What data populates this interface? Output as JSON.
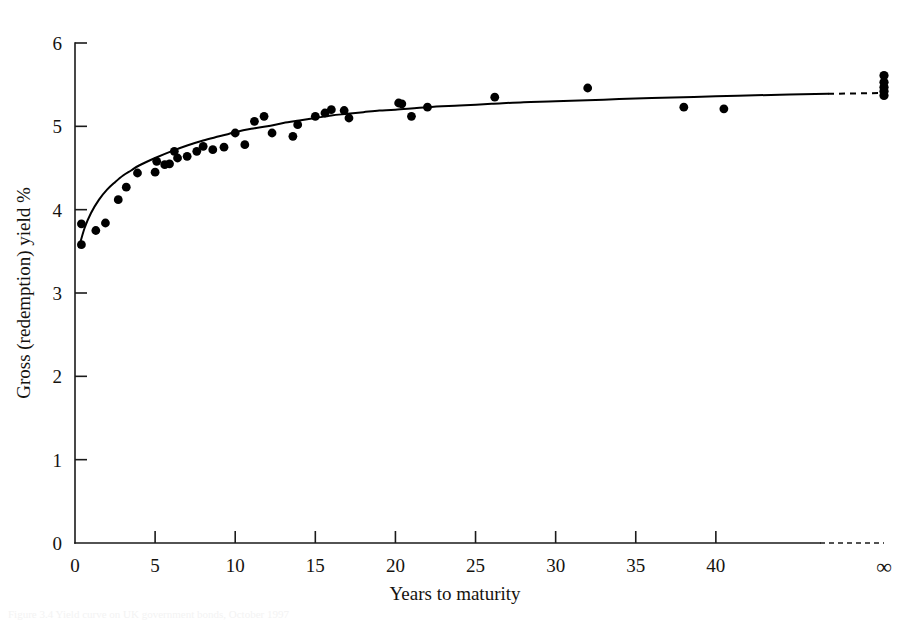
{
  "figure": {
    "background_color": "#ffffff",
    "ink_color": "#000000",
    "bottom_partial_caption": "Figure 3.4 Yield curve on UK government bonds, October 1997"
  },
  "chart_data": {
    "type": "scatter",
    "title": "",
    "subtitle": "",
    "xlabel": "Years to maturity",
    "ylabel": "Gross (redemption) yield %",
    "xlim": [
      0,
      50
    ],
    "ylim": [
      0,
      6
    ],
    "grid": false,
    "legend": null,
    "x_ticks": [
      "0",
      "5",
      "10",
      "15",
      "20",
      "25",
      "30",
      "35",
      "40"
    ],
    "x_tick_values": [
      0,
      5,
      10,
      15,
      20,
      25,
      30,
      35,
      40
    ],
    "x_extra_tick_label": "∞",
    "y_ticks": [
      "0",
      "1",
      "2",
      "3",
      "4",
      "5",
      "6"
    ],
    "y_tick_values": [
      0,
      1,
      2,
      3,
      4,
      5,
      6
    ],
    "axis_dashed_tail": true,
    "series": [
      {
        "name": "Gross redemption yield observations",
        "marker": "filled-circle",
        "color": "#000000",
        "points": [
          [
            0.4,
            3.83
          ],
          [
            0.4,
            3.58
          ],
          [
            1.3,
            3.75
          ],
          [
            1.9,
            3.84
          ],
          [
            2.7,
            4.12
          ],
          [
            3.2,
            4.27
          ],
          [
            3.9,
            4.44
          ],
          [
            5.0,
            4.45
          ],
          [
            5.1,
            4.58
          ],
          [
            5.6,
            4.54
          ],
          [
            5.9,
            4.55
          ],
          [
            6.2,
            4.7
          ],
          [
            6.4,
            4.62
          ],
          [
            7.0,
            4.64
          ],
          [
            7.6,
            4.7
          ],
          [
            8.0,
            4.76
          ],
          [
            8.6,
            4.72
          ],
          [
            9.3,
            4.75
          ],
          [
            10.0,
            4.92
          ],
          [
            10.6,
            4.78
          ],
          [
            11.2,
            5.06
          ],
          [
            11.8,
            5.12
          ],
          [
            12.3,
            4.92
          ],
          [
            13.6,
            4.88
          ],
          [
            13.9,
            5.02
          ],
          [
            15.0,
            5.12
          ],
          [
            15.6,
            5.16
          ],
          [
            16.0,
            5.2
          ],
          [
            16.8,
            5.19
          ],
          [
            17.1,
            5.1
          ],
          [
            20.2,
            5.28
          ],
          [
            20.4,
            5.27
          ],
          [
            21.0,
            5.12
          ],
          [
            22.0,
            5.23
          ],
          [
            26.2,
            5.35
          ],
          [
            32.0,
            5.46
          ],
          [
            38.0,
            5.23
          ],
          [
            40.5,
            5.21
          ]
        ]
      },
      {
        "name": "Undated (perpetual) stocks at infinity",
        "marker": "filled-circle",
        "color": "#000000",
        "at_infinity": true,
        "values": [
          5.61,
          5.53,
          5.47,
          5.42,
          5.37
        ]
      }
    ],
    "fitted_curve": {
      "name": "Fitted yield curve",
      "style": "solid-with-dashed-tail",
      "color": "#000000",
      "points": [
        [
          0.25,
          3.55
        ],
        [
          0.6,
          3.78
        ],
        [
          1.0,
          3.96
        ],
        [
          1.5,
          4.12
        ],
        [
          2.0,
          4.24
        ],
        [
          2.5,
          4.33
        ],
        [
          3.0,
          4.41
        ],
        [
          3.5,
          4.47
        ],
        [
          4.0,
          4.53
        ],
        [
          5.0,
          4.62
        ],
        [
          6.0,
          4.7
        ],
        [
          7.0,
          4.77
        ],
        [
          8.0,
          4.83
        ],
        [
          9.0,
          4.88
        ],
        [
          10.0,
          4.93
        ],
        [
          11.0,
          4.97
        ],
        [
          12.0,
          5.0
        ],
        [
          13.0,
          5.04
        ],
        [
          14.0,
          5.07
        ],
        [
          15.0,
          5.1
        ],
        [
          16.0,
          5.13
        ],
        [
          17.0,
          5.15
        ],
        [
          18.0,
          5.17
        ],
        [
          19.0,
          5.19
        ],
        [
          20.0,
          5.2
        ],
        [
          22.0,
          5.23
        ],
        [
          24.0,
          5.25
        ],
        [
          26.0,
          5.27
        ],
        [
          28.0,
          5.29
        ],
        [
          30.0,
          5.3
        ],
        [
          33.0,
          5.32
        ],
        [
          36.0,
          5.34
        ],
        [
          40.0,
          5.36
        ],
        [
          44.0,
          5.38
        ],
        [
          47.0,
          5.39
        ]
      ],
      "dashed_tail_from": 47.0,
      "dashed_tail_to": 50.0,
      "asymptote_value": 5.4
    }
  }
}
